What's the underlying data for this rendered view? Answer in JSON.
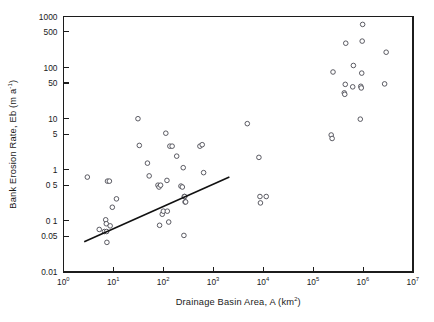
{
  "chart_data": {
    "type": "scatter",
    "title": "",
    "xlabel": "Drainage Basin Area, A (km2)",
    "xlabel_base": "Drainage Basin Area, A (km",
    "xlabel_sup": "2",
    "xlabel_tail": ")",
    "ylabel_base": "Bank Erosion Rate, Eb (m a",
    "ylabel_sup": "-1",
    "ylabel_tail": ")",
    "xscale": "log",
    "yscale": "log",
    "xlim": [
      1,
      10000000
    ],
    "ylim": [
      0.01,
      1000
    ],
    "grid": false,
    "legend": "none",
    "x_tick_labels": [
      {
        "base": "10",
        "exp": "0",
        "value": 1
      },
      {
        "base": "10",
        "exp": "1",
        "value": 10
      },
      {
        "base": "10",
        "exp": "2",
        "value": 100
      },
      {
        "base": "10",
        "exp": "3",
        "value": 1000
      },
      {
        "base": "10",
        "exp": "4",
        "value": 10000
      },
      {
        "base": "10",
        "exp": "5",
        "value": 100000
      },
      {
        "base": "10",
        "exp": "6",
        "value": 1000000
      },
      {
        "base": "10",
        "exp": "7",
        "value": 10000000
      }
    ],
    "y_tick_labels": [
      {
        "text": "0.01",
        "value": 0.01
      },
      {
        "text": "0.05",
        "value": 0.05
      },
      {
        "text": "0 1",
        "value": 0.1
      },
      {
        "text": "0 5",
        "value": 0.5
      },
      {
        "text": "1",
        "value": 1
      },
      {
        "text": "5",
        "value": 5
      },
      {
        "text": "10",
        "value": 10
      },
      {
        "text": "50",
        "value": 50
      },
      {
        "text": "100",
        "value": 100
      },
      {
        "text": "500",
        "value": 500
      },
      {
        "text": "1000",
        "value": 1000
      }
    ],
    "series": [
      {
        "name": "Bank erosion observations",
        "marker": "open-circle",
        "color": "#4a4a52",
        "points": [
          [
            3.0,
            0.72
          ],
          [
            5.2,
            0.068
          ],
          [
            6.6,
            0.062
          ],
          [
            7.0,
            0.105
          ],
          [
            7.2,
            0.088
          ],
          [
            7.3,
            0.062
          ],
          [
            7.4,
            0.038
          ],
          [
            7.6,
            0.6
          ],
          [
            8.3,
            0.6
          ],
          [
            8.6,
            0.08
          ],
          [
            9.5,
            0.185
          ],
          [
            11.5,
            0.27
          ],
          [
            31.0,
            10.0
          ],
          [
            33.0,
            3.0
          ],
          [
            48.0,
            1.35
          ],
          [
            52.0,
            0.76
          ],
          [
            78.0,
            0.5
          ],
          [
            82.0,
            0.46
          ],
          [
            84.0,
            0.082
          ],
          [
            88.0,
            0.5
          ],
          [
            95.0,
            0.135
          ],
          [
            100.0,
            0.155
          ],
          [
            112.0,
            5.2
          ],
          [
            118.0,
            0.62
          ],
          [
            120.0,
            0.155
          ],
          [
            128.0,
            0.095
          ],
          [
            135.0,
            2.9
          ],
          [
            150.0,
            2.9
          ],
          [
            185.0,
            1.85
          ],
          [
            225.0,
            0.48
          ],
          [
            240.0,
            0.46
          ],
          [
            250.0,
            1.1
          ],
          [
            258.0,
            0.052
          ],
          [
            262.0,
            0.3
          ],
          [
            268.0,
            0.3
          ],
          [
            272.0,
            0.235
          ],
          [
            280.0,
            0.235
          ],
          [
            540.0,
            2.9
          ],
          [
            600.0,
            3.1
          ],
          [
            640.0,
            0.88
          ],
          [
            4800.0,
            8.0
          ],
          [
            8200.0,
            1.75
          ],
          [
            8600.0,
            0.3
          ],
          [
            8800.0,
            0.225
          ],
          [
            11500.0,
            0.3
          ],
          [
            230000.0,
            4.8
          ],
          [
            240000.0,
            4.1
          ],
          [
            250000.0,
            82.0
          ],
          [
            420000.0,
            32.0
          ],
          [
            430000.0,
            30.0
          ],
          [
            440000.0,
            47.0
          ],
          [
            450000.0,
            300.0
          ],
          [
            620000.0,
            42.0
          ],
          [
            640000.0,
            110.0
          ],
          [
            880000.0,
            9.8
          ],
          [
            900000.0,
            43.0
          ],
          [
            920000.0,
            40.0
          ],
          [
            940000.0,
            78.0
          ],
          [
            960000.0,
            330.0
          ],
          [
            980000.0,
            700.0
          ],
          [
            2700000.0,
            48.0
          ],
          [
            2900000.0,
            200.0
          ]
        ]
      }
    ],
    "trend_line": {
      "name": "regression-line",
      "color": "#111111",
      "x_start": 2.6,
      "y_start": 0.039,
      "x_end": 2100.0,
      "y_end": 0.72
    }
  }
}
